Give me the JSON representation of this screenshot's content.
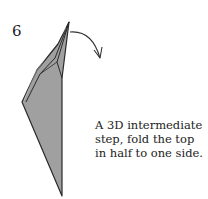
{
  "diagram": {
    "step_number": "6",
    "caption_lines": [
      "A 3D intermediate",
      "step, fold the top",
      "in half to one side."
    ],
    "colors": {
      "paper_fill": "#a0a0a0",
      "outline": "#2a2a2a",
      "arrow": "#333333",
      "background": "#ffffff"
    }
  }
}
